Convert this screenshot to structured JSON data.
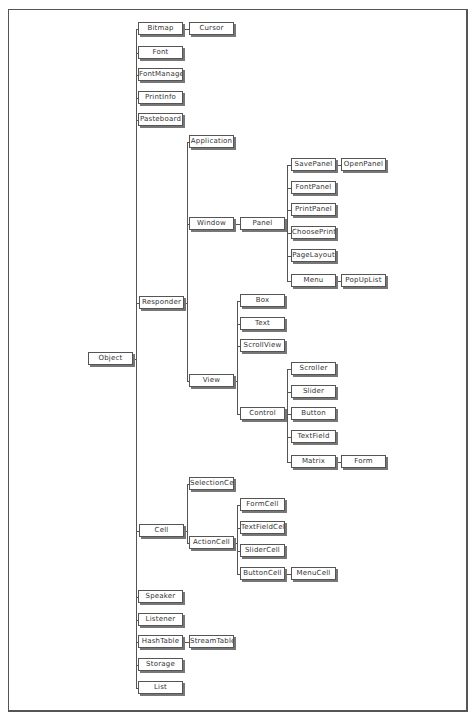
{
  "diagram": {
    "root": "Object",
    "nodes": {
      "object": "Object",
      "bitmap": "Bitmap",
      "cursor": "Cursor",
      "font": "Font",
      "fontmanager": "FontManager",
      "printinfo": "PrintInfo",
      "pasteboard": "Pasteboard",
      "responder": "Responder",
      "application": "Application",
      "window": "Window",
      "panel": "Panel",
      "savepanel": "SavePanel",
      "openpanel": "OpenPanel",
      "fontpanel": "FontPanel",
      "printpanel": "PrintPanel",
      "chooseprinter": "ChoosePrinte",
      "pagelayout": "PageLayout",
      "menu": "Menu",
      "popuplist": "PopUpList",
      "view": "View",
      "box": "Box",
      "text": "Text",
      "scrollview": "ScrollView",
      "control": "Control",
      "scroller": "Scroller",
      "slider": "Slider",
      "button": "Button",
      "textfield": "TextField",
      "matrix": "Matrix",
      "form": "Form",
      "cell": "Cell",
      "selectioncell": "SelectionCell",
      "actioncell": "ActionCell",
      "formcell": "FormCell",
      "textfieldcell": "TextFieldCell",
      "slidercell": "SliderCell",
      "buttoncell": "ButtonCell",
      "menucell": "MenuCell",
      "speaker": "Speaker",
      "listener": "Listener",
      "hashtable": "HashTable",
      "streamtable": "StreamTable",
      "storage": "Storage",
      "list": "List"
    },
    "edges": [
      [
        "Object",
        "Bitmap"
      ],
      [
        "Bitmap",
        "Cursor"
      ],
      [
        "Object",
        "Font"
      ],
      [
        "Object",
        "FontManager"
      ],
      [
        "Object",
        "PrintInfo"
      ],
      [
        "Object",
        "Pasteboard"
      ],
      [
        "Object",
        "Responder"
      ],
      [
        "Responder",
        "Application"
      ],
      [
        "Responder",
        "Window"
      ],
      [
        "Window",
        "Panel"
      ],
      [
        "Panel",
        "SavePanel"
      ],
      [
        "SavePanel",
        "OpenPanel"
      ],
      [
        "Panel",
        "FontPanel"
      ],
      [
        "Panel",
        "PrintPanel"
      ],
      [
        "Panel",
        "ChoosePrinter"
      ],
      [
        "Panel",
        "PageLayout"
      ],
      [
        "Panel",
        "Menu"
      ],
      [
        "Menu",
        "PopUpList"
      ],
      [
        "Responder",
        "View"
      ],
      [
        "View",
        "Box"
      ],
      [
        "View",
        "Text"
      ],
      [
        "View",
        "ScrollView"
      ],
      [
        "View",
        "Control"
      ],
      [
        "Control",
        "Scroller"
      ],
      [
        "Control",
        "Slider"
      ],
      [
        "Control",
        "Button"
      ],
      [
        "Control",
        "TextField"
      ],
      [
        "Control",
        "Matrix"
      ],
      [
        "Matrix",
        "Form"
      ],
      [
        "Object",
        "Cell"
      ],
      [
        "Cell",
        "SelectionCell"
      ],
      [
        "Cell",
        "ActionCell"
      ],
      [
        "ActionCell",
        "FormCell"
      ],
      [
        "ActionCell",
        "TextFieldCell"
      ],
      [
        "ActionCell",
        "SliderCell"
      ],
      [
        "ActionCell",
        "ButtonCell"
      ],
      [
        "ButtonCell",
        "MenuCell"
      ],
      [
        "Object",
        "Speaker"
      ],
      [
        "Object",
        "Listener"
      ],
      [
        "Object",
        "HashTable"
      ],
      [
        "HashTable",
        "StreamTable"
      ],
      [
        "Object",
        "Storage"
      ],
      [
        "Object",
        "List"
      ]
    ]
  }
}
